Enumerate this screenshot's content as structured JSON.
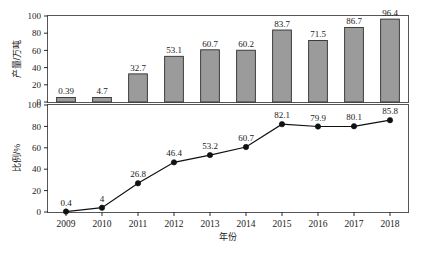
{
  "chart_data": [
    {
      "type": "bar",
      "title": "",
      "xlabel": "",
      "ylabel": "产量/万吨",
      "categories": [
        "2009",
        "2010",
        "2011",
        "2012",
        "2013",
        "2014",
        "2015",
        "2016",
        "2017",
        "2018"
      ],
      "values": [
        0.39,
        4.7,
        32.7,
        53.1,
        60.7,
        60.2,
        83.7,
        71.5,
        86.7,
        96.4
      ],
      "value_labels": [
        "0.39",
        "4.7",
        "32.7",
        "53.1",
        "60.7",
        "60.2",
        "83.7",
        "71.5",
        "86.7",
        "96.4"
      ],
      "ylim": [
        0,
        100
      ],
      "yticks": [
        0,
        20,
        40,
        60,
        80,
        100
      ],
      "ytick_labels": [
        "0",
        "20",
        "40",
        "60",
        "80",
        "100"
      ],
      "grid": false,
      "legend": "none",
      "bar_fill": "#9b9b9b",
      "bar_edge": "#2d2d2d"
    },
    {
      "type": "line",
      "title": "",
      "xlabel": "年份",
      "ylabel": "比例/%",
      "categories": [
        "2009",
        "2010",
        "2011",
        "2012",
        "2013",
        "2014",
        "2015",
        "2016",
        "2017",
        "2018"
      ],
      "values": [
        0.4,
        4,
        26.8,
        46.4,
        53.2,
        60.7,
        82.1,
        79.9,
        80.1,
        85.8
      ],
      "value_labels": [
        "0.4",
        "4",
        "26.8",
        "46.4",
        "53.2",
        "60.7",
        "82.1",
        "79.9",
        "80.1",
        "85.8"
      ],
      "ylim": [
        0,
        100
      ],
      "yticks": [
        0,
        20,
        40,
        60,
        80,
        100
      ],
      "ytick_labels": [
        "0",
        "20",
        "40",
        "60",
        "80",
        "100"
      ],
      "grid": false,
      "legend": "none",
      "line_color": "#111111",
      "marker": "filled-circle"
    }
  ],
  "figure": {
    "background": "#ffffff",
    "frame_color": "#55565a"
  }
}
